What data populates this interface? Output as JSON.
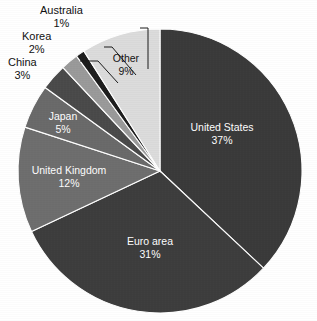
{
  "chart_data": {
    "type": "pie",
    "title": "",
    "subtitle": "",
    "xlabel": "",
    "ylabel": "",
    "legend_position": "none",
    "grid": false,
    "unit": "%",
    "start_angle_deg": 0,
    "direction": "clockwise",
    "categories": [
      "United States",
      "Euro area",
      "United Kingdom",
      "Japan",
      "China",
      "Korea",
      "Australia",
      "Other"
    ],
    "values": [
      37,
      31,
      12,
      5,
      3,
      2,
      1,
      9
    ],
    "slices": [
      {
        "name": "United States",
        "value": 37,
        "value_label": "37%",
        "color": "#3a3a3a",
        "label_placement": "inside",
        "text_color": "#ffffff",
        "start_deg": 0,
        "end_deg": 133.2,
        "label_x": 222,
        "label_y": 131
      },
      {
        "name": "Euro area",
        "value": 31,
        "value_label": "31%",
        "color": "#3d3d3d",
        "label_placement": "inside",
        "text_color": "#ffffff",
        "start_deg": 133.2,
        "end_deg": 244.8,
        "label_x": 150,
        "label_y": 245
      },
      {
        "name": "United Kingdom",
        "value": 12,
        "value_label": "12%",
        "color": "#6e6e6e",
        "label_placement": "inside",
        "text_color": "#ffffff",
        "start_deg": 244.8,
        "end_deg": 288,
        "label_x": 69,
        "label_y": 174
      },
      {
        "name": "Japan",
        "value": 5,
        "value_label": "5%",
        "color": "#6a6a6a",
        "label_placement": "inside",
        "text_color": "#ffffff",
        "start_deg": 288,
        "end_deg": 306,
        "label_x": 63,
        "label_y": 120
      },
      {
        "name": "China",
        "value": 3,
        "value_label": "3%",
        "color": "#4a4a4a",
        "label_placement": "outside",
        "text_color": "#111111",
        "start_deg": 306,
        "end_deg": 316.8,
        "label_x": 8,
        "label_y": 56
      },
      {
        "name": "Korea",
        "value": 2,
        "value_label": "2%",
        "color": "#9a9a9a",
        "label_placement": "outside",
        "text_color": "#111111",
        "start_deg": 316.8,
        "end_deg": 324,
        "label_x": 22,
        "label_y": 30
      },
      {
        "name": "Australia",
        "value": 1,
        "value_label": "1%",
        "color": "#1d1d1d",
        "label_placement": "outside",
        "text_color": "#111111",
        "start_deg": 324,
        "end_deg": 327.6,
        "label_x": 40,
        "label_y": 4
      },
      {
        "name": "Other",
        "value": 9,
        "value_label": "9%",
        "color": "#dcdcdc",
        "label_placement": "inside",
        "text_color": "#141414",
        "start_deg": 327.6,
        "end_deg": 360,
        "label_x": 126,
        "label_y": 62
      }
    ],
    "geometry": {
      "center_x": 160,
      "center_y": 171,
      "radius": 142
    },
    "background_color": "#ffffff"
  }
}
